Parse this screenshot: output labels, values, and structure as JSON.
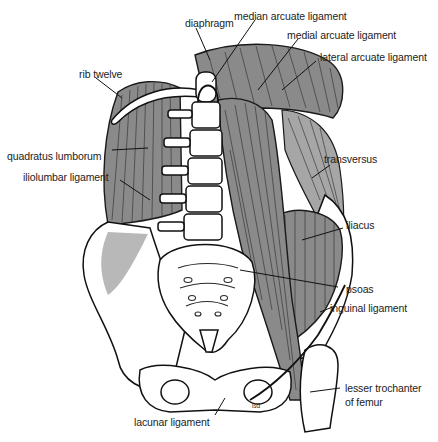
{
  "figure": {
    "colors": {
      "muscle": "#8a8a8a",
      "muscle_light": "#a6a6a6",
      "bone": "#ffffff",
      "outline": "#111111",
      "label_text": "#222222"
    },
    "labels": {
      "diaphragm": "diaphragm",
      "median_arcuate": "median arcuate ligament",
      "medial_arcuate": "medial arcuate ligament",
      "lateral_arcuate": "lateral arcuate ligament",
      "rib_twelve": "rib twelve",
      "quadratus_lumborum": "quadratus lumborum",
      "iliolumbar": "iliolumbar ligament",
      "transversus": "transversus",
      "iliacus": "iliacus",
      "psoas": "psoas",
      "inguinal": "inguinal ligament",
      "lesser_trochanter_1": "lesser trochanter",
      "lesser_trochanter_2": "of femur",
      "lacunar": "lacunar ligament",
      "signature": "ßd"
    }
  }
}
